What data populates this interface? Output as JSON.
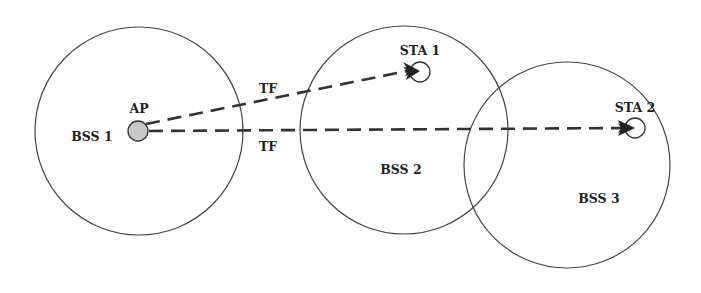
{
  "diagram": {
    "title": "",
    "nodes": {
      "bss1": {
        "label": "BSS 1",
        "cx": 139,
        "cy": 131,
        "r": 104
      },
      "bss2": {
        "label": "BSS 2",
        "cx": 404,
        "cy": 130,
        "r": 104
      },
      "bss3": {
        "label": "BSS 3",
        "cx": 567,
        "cy": 165,
        "r": 103
      },
      "ap": {
        "label": "AP",
        "cx": 138,
        "cy": 131,
        "r": 10,
        "fill": "#c8c8c8"
      },
      "sta1": {
        "label": "STA 1",
        "cx": 418,
        "cy": 72,
        "r": 10
      },
      "sta2": {
        "label": "STA 2",
        "cx": 634,
        "cy": 128,
        "r": 10
      }
    },
    "edges": [
      {
        "from": "AP",
        "to": "STA 1",
        "label": "TF",
        "style": "dashed-arrow"
      },
      {
        "from": "AP",
        "to": "STA 2",
        "label": "TF",
        "style": "dashed-arrow"
      }
    ],
    "colors": {
      "stroke": "#333333",
      "ap_fill": "#c8c8c8",
      "background": "#ffffff"
    }
  }
}
